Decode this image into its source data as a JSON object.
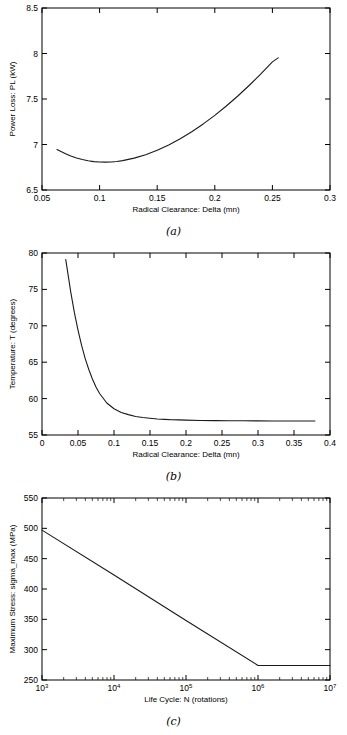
{
  "figure": {
    "background_color": "#ffffff",
    "line_color": "#1a1a1a",
    "axis_color": "#000000"
  },
  "panels": [
    {
      "id": "a",
      "caption": "(a)"
    },
    {
      "id": "b",
      "caption": "(b)"
    },
    {
      "id": "c",
      "caption": "(c)"
    }
  ],
  "chart_data": [
    {
      "type": "line",
      "panel": "a",
      "title": "",
      "xlabel": "Radical Clearance: Delta (mn)",
      "ylabel": "Power Loss: PL (kW)",
      "xlim": [
        0.05,
        0.3
      ],
      "ylim": [
        6.5,
        8.5
      ],
      "xticks": [
        0.05,
        0.1,
        0.15,
        0.2,
        0.25,
        0.3
      ],
      "xticklabels": [
        "0.05",
        "0.1",
        "0.15",
        "0.2",
        "0.25",
        "0.3"
      ],
      "yticks": [
        6.5,
        7,
        7.5,
        8,
        8.5
      ],
      "yticklabels": [
        "6.5",
        "7",
        "7.5",
        "8",
        "8.5"
      ],
      "xscale": "linear",
      "yscale": "linear",
      "grid": false,
      "legend": null,
      "series": [
        {
          "name": "Power Loss",
          "x": [
            0.063,
            0.07,
            0.075,
            0.08,
            0.085,
            0.09,
            0.095,
            0.1,
            0.105,
            0.11,
            0.115,
            0.12,
            0.13,
            0.14,
            0.15,
            0.16,
            0.17,
            0.18,
            0.19,
            0.2,
            0.21,
            0.22,
            0.23,
            0.24,
            0.25,
            0.255
          ],
          "y": [
            6.945,
            6.9,
            6.873,
            6.852,
            6.835,
            6.822,
            6.812,
            6.807,
            6.806,
            6.808,
            6.814,
            6.823,
            6.85,
            6.888,
            6.936,
            6.995,
            7.063,
            7.14,
            7.226,
            7.32,
            7.423,
            7.533,
            7.651,
            7.776,
            7.908,
            7.952
          ]
        }
      ],
      "minimum_point": {
        "x": 0.103,
        "y": 6.806
      }
    },
    {
      "type": "line",
      "panel": "b",
      "title": "",
      "xlabel": "Radical Clearance: Delta (mn)",
      "ylabel": "Temperature: T (degrees)",
      "xlim": [
        0,
        0.4
      ],
      "ylim": [
        55,
        80
      ],
      "xticks": [
        0,
        0.05,
        0.1,
        0.15,
        0.2,
        0.25,
        0.3,
        0.35,
        0.4
      ],
      "xticklabels": [
        "0",
        "0.05",
        "0.1",
        "0.15",
        "0.2",
        "0.25",
        "0.3",
        "0.35",
        "0.4"
      ],
      "yticks": [
        55,
        60,
        65,
        70,
        75,
        80
      ],
      "yticklabels": [
        "55",
        "60",
        "65",
        "70",
        "75",
        "80"
      ],
      "xscale": "linear",
      "yscale": "linear",
      "grid": false,
      "legend": null,
      "series": [
        {
          "name": "Temperature",
          "x": [
            0.033,
            0.04,
            0.045,
            0.05,
            0.055,
            0.06,
            0.065,
            0.07,
            0.075,
            0.08,
            0.09,
            0.1,
            0.11,
            0.12,
            0.13,
            0.14,
            0.15,
            0.16,
            0.17,
            0.18,
            0.19,
            0.2,
            0.22,
            0.24,
            0.26,
            0.28,
            0.3,
            0.32,
            0.34,
            0.36,
            0.379
          ],
          "y": [
            79.1,
            74.6,
            71.8,
            69.4,
            67.3,
            65.5,
            64.0,
            62.7,
            61.6,
            60.7,
            59.4,
            58.6,
            58.1,
            57.8,
            57.55,
            57.4,
            57.3,
            57.2,
            57.15,
            57.1,
            57.08,
            57.05,
            57.0,
            56.98,
            56.96,
            56.95,
            56.94,
            56.93,
            56.93,
            56.92,
            56.92
          ]
        }
      ],
      "asymptote": 56.9
    },
    {
      "type": "line",
      "panel": "c",
      "title": "",
      "xlabel": "Life Cycle: N (rotations)",
      "ylabel": "Maximum Stress: sigma_max (MPa)",
      "xlim": [
        1000,
        10000000
      ],
      "ylim": [
        250,
        550
      ],
      "xticks": [
        1000,
        10000,
        100000,
        1000000,
        10000000
      ],
      "xticklabels": [
        "10^3",
        "10^4",
        "10^5",
        "10^6",
        "10^7"
      ],
      "yticks": [
        250,
        300,
        350,
        400,
        450,
        500,
        550
      ],
      "yticklabels": [
        "250",
        "300",
        "350",
        "400",
        "450",
        "500",
        "550"
      ],
      "xscale": "log",
      "yscale": "linear",
      "grid": false,
      "legend": null,
      "series": [
        {
          "name": "S-N curve",
          "x": [
            1000,
            10000,
            100000,
            1000000,
            10000000
          ],
          "y": [
            497,
            423,
            348,
            274,
            274
          ]
        }
      ],
      "knee_point": {
        "x": 1000000,
        "y": 274
      },
      "endurance_limit": 274
    }
  ]
}
